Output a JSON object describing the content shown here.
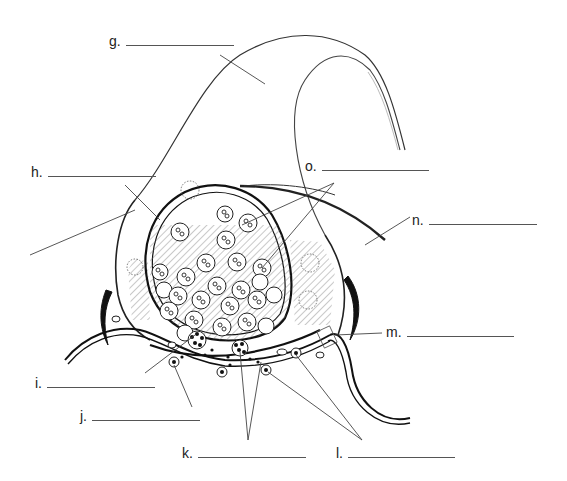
{
  "diagram": {
    "labels": [
      {
        "id": "g",
        "text": "g.",
        "x": 109,
        "y": 37,
        "blank_width": 108,
        "points_to": "axon (top nerve fiber)"
      },
      {
        "id": "h",
        "text": "h.",
        "x": 31,
        "y": 167,
        "blank_width": 108,
        "points_to": "presynaptic cytoplasm region"
      },
      {
        "id": "i",
        "text": "i.",
        "x": 35,
        "y": 378,
        "blank_width": 108,
        "points_to": "vesicle fusing at active zone"
      },
      {
        "id": "j",
        "text": "j.",
        "x": 80,
        "y": 412,
        "blank_width": 108,
        "points_to": "receptor on postsynaptic membrane"
      },
      {
        "id": "k",
        "text": "k.",
        "x": 182,
        "y": 448,
        "blank_width": 108,
        "points_to": "neurotransmitter molecules in synaptic cleft"
      },
      {
        "id": "l",
        "text": "l.",
        "x": 336,
        "y": 448,
        "blank_width": 107,
        "points_to": "postsynaptic receptors / channels"
      },
      {
        "id": "m",
        "text": "m.",
        "x": 386,
        "y": 327,
        "blank_width": 107,
        "points_to": "synaptic cleft"
      },
      {
        "id": "n",
        "text": "n.",
        "x": 412,
        "y": 215,
        "blank_width": 108,
        "points_to": "Schwann cell / glial cell"
      },
      {
        "id": "o",
        "text": "o.",
        "x": 305,
        "y": 161,
        "blank_width": 107,
        "points_to": "synaptic vesicles"
      }
    ]
  }
}
